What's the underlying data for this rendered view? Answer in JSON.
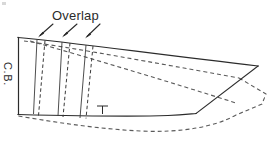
{
  "figure": {
    "name": "pattern-overlap-diagram",
    "background_color": "#ffffff",
    "line_color": "#2b2b2b",
    "dashed_color": "#5a5a5a",
    "width": 270,
    "height": 152
  },
  "labels": {
    "overlap": "Overlap",
    "center_back": "C.B."
  },
  "annotations": {
    "arrow_count": 3,
    "arrows": [
      {
        "name": "overlap-arrow-1",
        "from_x": 52,
        "from_y": 23,
        "to_x": 38,
        "to_y": 36
      },
      {
        "name": "overlap-arrow-2",
        "from_x": 75,
        "from_y": 23,
        "to_x": 62,
        "to_y": 36
      },
      {
        "name": "overlap-arrow-3",
        "from_x": 98,
        "from_y": 23,
        "to_x": 85,
        "to_y": 36
      }
    ],
    "notch": {
      "name": "notch-mark",
      "x": 102,
      "y": 110,
      "arm": 5,
      "stem": 7
    }
  },
  "geometry": {
    "solid_outline": "M18,38 L258,66 L198,114 L18,114 Z",
    "top_edge": "M18,38 L258,66",
    "left_edge_cb": "M18,38 L18,114",
    "bottom_edge": "M18,114 L105,113 L160,114 L198,114",
    "right_edge": "M258,66 L198,114",
    "solid_top_path": "M18,38 L120,49 L258,66",
    "solid_bottom_path": "M18,114 L70,116 L140,117 L198,114",
    "solid_tip_path": "M258,66 L225,92 L200,113",
    "dashed_outline": "M18,38 L238,78 L208,104 L160,130 L80,128 L18,114",
    "dashed_top": "M22,40 L130,58 L240,78",
    "dashed_bottom": "M18,116 L70,122 L140,131 L195,130 L236,112 L265,96",
    "slash_lines": [
      {
        "name": "slash-line-1-solid",
        "x1": 38,
        "y1": 38,
        "x2": 34,
        "y2": 114
      },
      {
        "name": "slash-line-1-dashed",
        "x1": 45,
        "y1": 39,
        "x2": 38,
        "y2": 116
      },
      {
        "name": "slash-line-2-solid",
        "x1": 62,
        "y1": 41,
        "x2": 58,
        "y2": 116
      },
      {
        "name": "slash-line-2-dashed",
        "x1": 70,
        "y1": 42,
        "x2": 63,
        "y2": 117
      },
      {
        "name": "slash-line-3-solid",
        "x1": 86,
        "y1": 43,
        "x2": 80,
        "y2": 118
      },
      {
        "name": "slash-line-3-dashed",
        "x1": 93,
        "y1": 45,
        "x2": 86,
        "y2": 119
      }
    ]
  }
}
